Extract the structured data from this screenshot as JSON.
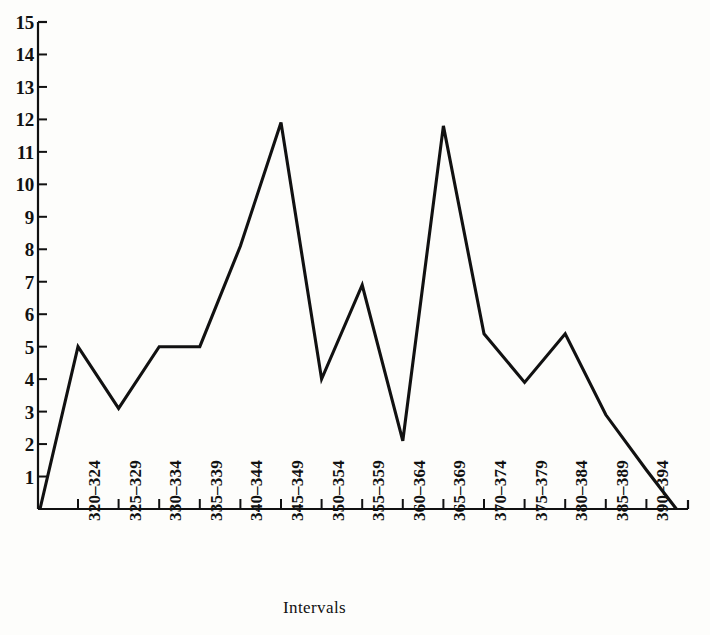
{
  "chart_data": {
    "type": "line",
    "title": "",
    "xlabel": "Intervals",
    "ylabel": "",
    "categories": [
      "320–324",
      "325–329",
      "330–334",
      "335–339",
      "340–344",
      "345–349",
      "350–354",
      "355–359",
      "360–364",
      "365–369",
      "370–374",
      "375–379",
      "380–384",
      "385–389",
      "390–394"
    ],
    "values": [
      5.0,
      3.1,
      5.0,
      5.0,
      8.1,
      11.9,
      4.0,
      6.9,
      2.1,
      11.8,
      5.4,
      3.9,
      5.4,
      2.9,
      1.2
    ],
    "baseline_start": 0,
    "baseline_end": 0,
    "ylim": [
      0,
      15
    ],
    "ytick_labels": [
      "15",
      "14",
      "13",
      "12",
      "11",
      "10",
      "9",
      "8",
      "7",
      "6",
      "5",
      "4",
      "3",
      "2",
      "1"
    ],
    "ytick_values": [
      15,
      14,
      13,
      12,
      11,
      10,
      9,
      8,
      7,
      6,
      5,
      4,
      3,
      2,
      1
    ],
    "grid": false,
    "legend": null,
    "line_color": "#111111",
    "axis_color": "#111111",
    "background_color": "#fdfdfb"
  },
  "axes": {
    "x_title": "Intervals"
  }
}
